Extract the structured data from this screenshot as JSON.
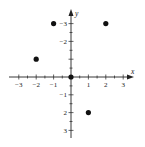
{
  "chart_data": {
    "type": "scatter",
    "title": "",
    "xlabel": "x",
    "ylabel": "y",
    "xlim": [
      -3.5,
      3.5
    ],
    "ylim": [
      -3.5,
      3.5
    ],
    "grid": false,
    "x_ticks": [
      -3,
      -2,
      -1,
      1,
      2,
      3
    ],
    "y_ticks": [
      -3,
      -2,
      -1,
      2,
      3
    ],
    "points": [
      {
        "x": -1,
        "y": 3
      },
      {
        "x": 2,
        "y": 3
      },
      {
        "x": -2,
        "y": 1
      },
      {
        "x": 0,
        "y": 0
      },
      {
        "x": 1,
        "y": -2
      }
    ]
  },
  "tick_labels": {
    "x": [
      "−3",
      "−2",
      "−1",
      "1",
      "2",
      "3"
    ],
    "y": [
      "3",
      "2",
      "−1",
      "−2",
      "−3"
    ]
  },
  "axis_labels": {
    "x": "x",
    "y": "y"
  }
}
